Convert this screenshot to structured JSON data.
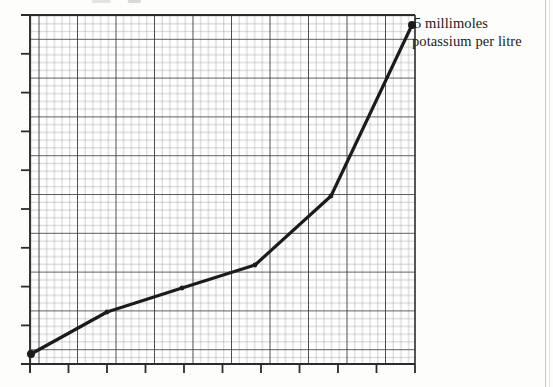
{
  "figure": {
    "background_color": "#fdfdfc",
    "ink_color": "#1b1b1b",
    "grid_major_color": "#3a3a3a",
    "grid_minor_color": "#8d8d8d"
  },
  "annotations": {
    "series_label_line1": "5 millimoles",
    "series_label_line2": "potassium per litre"
  },
  "chart_data": {
    "type": "line",
    "title": "",
    "subtitle": "",
    "xlabel": "",
    "ylabel": "",
    "grid": "graph-paper: major gridlines with 5 minor subdivisions each",
    "grid_major_cols": 10,
    "grid_major_rows": 9,
    "grid_minor_per_major": 5,
    "axis_tick_labels_x": [],
    "axis_tick_labels_y": [],
    "xlim": [
      0,
      10
    ],
    "ylim": [
      0,
      9
    ],
    "legend_position": "inline-right-end-of-curve",
    "series": [
      {
        "name": "5 millimoles potassium per litre",
        "marker": "filled-circle",
        "line_width_px": 3.2,
        "color": "#1b1b1b",
        "x": [
          0.0,
          2.0,
          4.0,
          5.9,
          7.9,
          10.0
        ],
        "y": [
          0.25,
          1.35,
          1.97,
          2.58,
          4.38,
          8.85
        ],
        "points_px": [
          [
            31,
            354
          ],
          [
            107,
            312
          ],
          [
            182,
            288
          ],
          [
            255,
            265
          ],
          [
            331,
            196
          ],
          [
            412,
            25
          ]
        ]
      }
    ]
  },
  "plot_geometry": {
    "left_px": 30,
    "right_px": 415,
    "top_px": 15,
    "bottom_px": 364,
    "major_step_x_px": 38.5,
    "major_step_y_px": 38.8,
    "tick_length_px": 9
  }
}
